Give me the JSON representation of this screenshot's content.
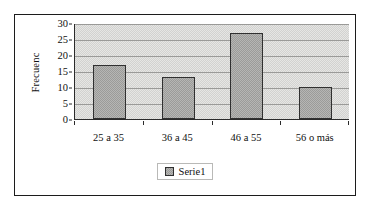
{
  "chart_data": {
    "type": "bar",
    "title": "",
    "subtitle": "",
    "xlabel": "",
    "ylabel": "Frecuenc",
    "categories": [
      "25 a 35",
      "36 a 45",
      "46 a 55",
      "56 o más"
    ],
    "values": [
      17,
      13,
      27,
      10
    ],
    "series": [
      {
        "name": "Serie1",
        "values": [
          17,
          13,
          27,
          10
        ]
      }
    ],
    "ylim": [
      0,
      30
    ],
    "ytick_labels": [
      "0",
      "5",
      "10",
      "15",
      "20",
      "25",
      "30"
    ],
    "ytick_values": [
      0,
      5,
      10,
      15,
      20,
      25,
      30
    ],
    "grid": "horizontal",
    "legend_position": "bottom",
    "legend_entries": [
      "Serie1"
    ],
    "colors": {
      "bar_fill": "#a8a8a6",
      "bar_border": "#303030",
      "plot_background": "#dededc",
      "gridline": "#9a9a98",
      "axis": "#2b2b2b",
      "text": "#101010",
      "frame_border": "#1c1c1c",
      "page_background": "#ffffff"
    }
  }
}
